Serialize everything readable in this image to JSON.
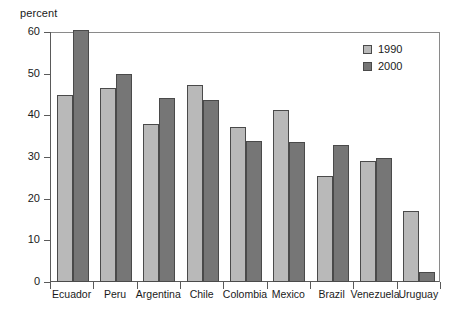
{
  "chart_data": {
    "type": "bar",
    "title": "",
    "subtitle": "",
    "xlabel": "",
    "ylabel": "percent",
    "ylim": [
      0,
      60
    ],
    "yticks": [
      0,
      10,
      20,
      30,
      40,
      50,
      60
    ],
    "grid": false,
    "legend_position": "top-right",
    "categories": [
      "Ecuador",
      "Peru",
      "Argentina",
      "Chile",
      "Colombia",
      "Mexico",
      "Brazil",
      "Venezuela",
      "Uruguay"
    ],
    "series": [
      {
        "name": "1990",
        "color": "#b9b9b9",
        "values": [
          45.0,
          46.5,
          38.0,
          47.2,
          37.2,
          41.3,
          25.5,
          29.0,
          17.0
        ]
      },
      {
        "name": "2000",
        "color": "#767676",
        "values": [
          60.5,
          50.0,
          44.2,
          43.6,
          33.8,
          33.5,
          32.8,
          29.7,
          2.5
        ]
      }
    ]
  },
  "axis": {
    "y_unit_label": "percent"
  },
  "legend": {
    "entries": [
      {
        "label": "1990",
        "color": "#b9b9b9"
      },
      {
        "label": "2000",
        "color": "#767676"
      }
    ]
  },
  "colors": {
    "series_1990": "#b9b9b9",
    "series_2000": "#767676",
    "axis_line": "#5a5a5a",
    "frame_line": "#8a8a8a",
    "bar_outline": "#4a4a4a",
    "background": "#ffffff",
    "text": "#1a1a1a"
  }
}
